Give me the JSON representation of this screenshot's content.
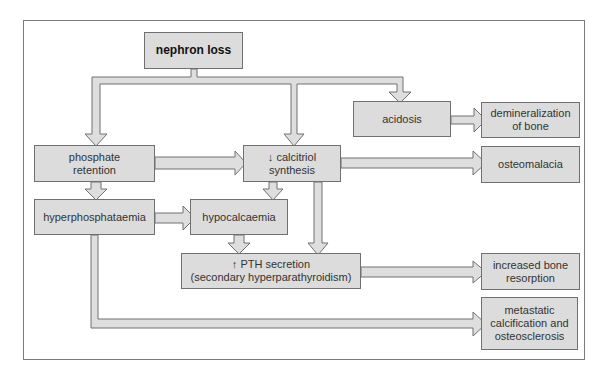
{
  "diagram": {
    "colors": {
      "box_fill": "#dcdcdc",
      "box_border": "#707070",
      "arrow_fill": "#dedede",
      "arrow_stroke": "#707070",
      "frame": "#7a7a7a"
    },
    "nodes": {
      "nephron_loss": "nephron loss",
      "acidosis": "acidosis",
      "demineralization": "demineralization\nof bone",
      "phosphate_retention": "phosphate\nretention",
      "calcitriol": "↓ calcitriol\nsynthesis",
      "osteomalacia": "osteomalacia",
      "hyperphosphataemia": "hyperphosphataemia",
      "hypocalcaemia": "hypocalcaemia",
      "pth": "↑ PTH secretion\n(secondary hyperparathyroidism)",
      "bone_resorption": "increased bone\nresorption",
      "metastatic": "metastatic\ncalcification and\nosteosclerosis"
    },
    "edges": [
      {
        "from": "nephron loss",
        "to": "phosphate retention"
      },
      {
        "from": "nephron loss",
        "to": "↓ calcitriol synthesis"
      },
      {
        "from": "nephron loss",
        "to": "acidosis"
      },
      {
        "from": "acidosis",
        "to": "demineralization of bone"
      },
      {
        "from": "phosphate retention",
        "to": "↓ calcitriol synthesis"
      },
      {
        "from": "phosphate retention",
        "to": "hyperphosphataemia"
      },
      {
        "from": "↓ calcitriol synthesis",
        "to": "osteomalacia"
      },
      {
        "from": "↓ calcitriol synthesis",
        "to": "hypocalcaemia"
      },
      {
        "from": "↓ calcitriol synthesis",
        "to": "↑ PTH secretion"
      },
      {
        "from": "hyperphosphataemia",
        "to": "hypocalcaemia"
      },
      {
        "from": "hypocalcaemia",
        "to": "↑ PTH secretion"
      },
      {
        "from": "↑ PTH secretion",
        "to": "increased bone resorption"
      },
      {
        "from": "hyperphosphataemia",
        "to": "metastatic calcification and osteosclerosis"
      }
    ]
  }
}
